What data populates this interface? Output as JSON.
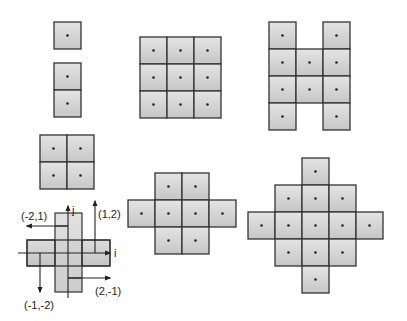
{
  "figure": {
    "colors": {
      "cell_fill_top": "#e2e2e2",
      "cell_fill_bottom": "#c8c8c8",
      "cell_stroke": "#333333",
      "dot": "#222222",
      "background": "#ffffff"
    },
    "cell_size": 27,
    "stencils": [
      {
        "name": "single",
        "origin": [
          54,
          22
        ],
        "cells": [
          [
            0,
            0
          ]
        ]
      },
      {
        "name": "vertical-pair",
        "origin": [
          54,
          63
        ],
        "cells": [
          [
            0,
            0
          ],
          [
            0,
            1
          ]
        ]
      },
      {
        "name": "square-3x3",
        "origin": [
          140,
          37
        ],
        "cells": [
          [
            0,
            0
          ],
          [
            1,
            0
          ],
          [
            2,
            0
          ],
          [
            0,
            1
          ],
          [
            1,
            1
          ],
          [
            2,
            1
          ],
          [
            0,
            2
          ],
          [
            1,
            2
          ],
          [
            2,
            2
          ]
        ]
      },
      {
        "name": "h-shape",
        "origin": [
          269,
          22
        ],
        "cells": [
          [
            0,
            0
          ],
          [
            2,
            0
          ],
          [
            0,
            1
          ],
          [
            1,
            1
          ],
          [
            2,
            1
          ],
          [
            0,
            2
          ],
          [
            1,
            2
          ],
          [
            2,
            2
          ],
          [
            0,
            3
          ],
          [
            2,
            3
          ]
        ]
      },
      {
        "name": "square-2x2",
        "origin": [
          40,
          135
        ],
        "cells": [
          [
            0,
            0
          ],
          [
            1,
            0
          ],
          [
            0,
            1
          ],
          [
            1,
            1
          ]
        ]
      },
      {
        "name": "plus-octagon",
        "origin": [
          128,
          173
        ],
        "cells": [
          [
            1,
            0
          ],
          [
            2,
            0
          ],
          [
            0,
            1
          ],
          [
            1,
            1
          ],
          [
            2,
            1
          ],
          [
            3,
            1
          ],
          [
            1,
            2
          ],
          [
            2,
            2
          ]
        ]
      },
      {
        "name": "diamond",
        "origin": [
          248,
          158
        ],
        "cells": [
          [
            2,
            0
          ],
          [
            1,
            1
          ],
          [
            2,
            1
          ],
          [
            3,
            1
          ],
          [
            0,
            2
          ],
          [
            1,
            2
          ],
          [
            2,
            2
          ],
          [
            3,
            2
          ],
          [
            4,
            2
          ],
          [
            1,
            3
          ],
          [
            2,
            3
          ],
          [
            3,
            3
          ],
          [
            2,
            4
          ]
        ]
      }
    ],
    "lattice_diagram": {
      "axis_labels": {
        "i": "i",
        "j": "j"
      },
      "vectors": [
        {
          "label": "(-2,1)"
        },
        {
          "label": "(1,2)"
        },
        {
          "label": "(-1,-2)"
        },
        {
          "label": "(2,-1)"
        }
      ]
    }
  }
}
